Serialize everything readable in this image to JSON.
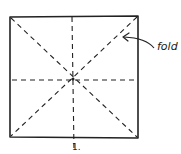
{
  "diagram": {
    "stroke_color": "#222222",
    "background_color": "#ffffff",
    "square": {
      "x": 10,
      "y": 17,
      "width": 128,
      "height": 120
    },
    "fold_lines": [
      {
        "name": "diagonal-tl-br",
        "style": "dashed"
      },
      {
        "name": "diagonal-tr-bl",
        "style": "dashed"
      },
      {
        "name": "horizontal-midline",
        "style": "dashed"
      },
      {
        "name": "vertical-midline",
        "style": "dashed"
      }
    ],
    "annotation": {
      "label": "fold",
      "arrow_target": "diagonal-tr-bl"
    },
    "step": {
      "label": "1."
    }
  }
}
